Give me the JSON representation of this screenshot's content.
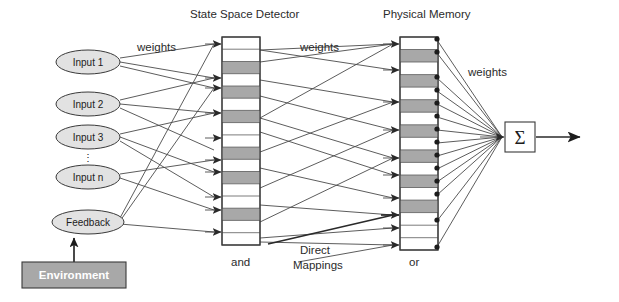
{
  "figure": {
    "background": "#ffffff"
  },
  "colors": {
    "cell_fill_light": "#ffffff",
    "cell_fill_dark": "#a8a8a8",
    "node_fill": "#e2e2e2",
    "environment_fill": "#a8a8a8",
    "environment_text": "#ffffff",
    "stroke": "#3a3a3a",
    "wire": "#4a4a4a"
  },
  "labels": {
    "state_space_detector": "State Space Detector",
    "physical_memory": "Physical Memory",
    "weights_left": "weights",
    "weights_mid": "weights",
    "weights_right": "weights",
    "and": "and",
    "or": "or",
    "direct_mappings_line1": "Direct",
    "direct_mappings_line2": "Mappings",
    "environment": "Environment",
    "sigma": "Σ",
    "vdots": "⋮"
  },
  "inputs": [
    {
      "label": "Input 1",
      "cx": 88,
      "cy": 62
    },
    {
      "label": "Input 2",
      "cx": 88,
      "cy": 104
    },
    {
      "label": "Input 3",
      "cx": 88,
      "cy": 137
    },
    {
      "label": "Input n",
      "cx": 88,
      "cy": 177
    },
    {
      "label": "Feedback",
      "cx": 88,
      "cy": 222
    }
  ],
  "environment_box": {
    "label": "Environment",
    "x": 22,
    "y": 262,
    "w": 104,
    "h": 26
  },
  "state_space_detector": {
    "x": 222,
    "y": 37,
    "w": 38,
    "h": 208,
    "cell_count": 17,
    "shaded_cells": [
      2,
      4,
      6,
      9,
      11,
      14,
      16
    ],
    "arrow_rows": [
      0,
      2,
      3,
      5,
      7,
      9,
      12,
      13,
      15
    ],
    "out_rows": [
      1,
      3,
      6,
      9,
      11,
      13,
      15,
      16
    ]
  },
  "physical_memory": {
    "x": 400,
    "y": 37,
    "w": 38,
    "h": 213,
    "cell_count": 17,
    "shaded_cells": [
      1,
      3,
      5,
      7,
      9,
      11,
      13,
      15
    ],
    "arrow_rows": [
      0,
      1,
      3,
      5,
      7,
      8,
      10,
      12,
      13,
      14,
      16
    ],
    "dot_rows": [
      0,
      1,
      3,
      5,
      6,
      7,
      8,
      9,
      10,
      11,
      12,
      13,
      14,
      16
    ]
  },
  "summation": {
    "symbol": "Σ",
    "x": 505,
    "y": 122,
    "w": 30,
    "h": 30
  },
  "output_arrow": {
    "from_x": 535,
    "to_x": 594,
    "y": 137
  }
}
